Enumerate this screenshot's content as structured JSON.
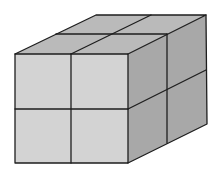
{
  "diagram": {
    "type": "isometric-cube-composite",
    "grid": {
      "width": 2,
      "height": 2,
      "depth": 2
    },
    "colors": {
      "front_face": "#d3d3d3",
      "top_face": "#bababa",
      "right_face": "#a8a8a8",
      "edge": "#1e1e1e",
      "background": "#ffffff"
    },
    "vertices": {
      "front_top_left": [
        15,
        54
      ],
      "front_top_right": [
        128,
        54
      ],
      "front_bottom_left": [
        15,
        163
      ],
      "front_bottom_right": [
        128,
        163
      ],
      "back_top_left": [
        96,
        15
      ],
      "back_top_right": [
        206,
        15
      ],
      "back_bottom_right": [
        207,
        124
      ]
    }
  }
}
